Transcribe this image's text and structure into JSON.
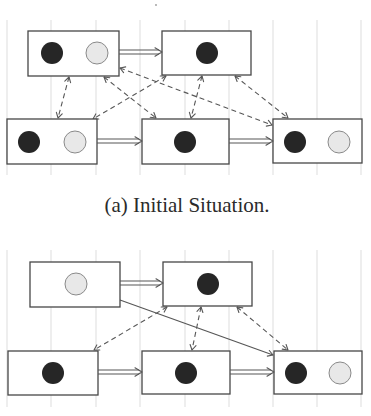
{
  "style": {
    "background": "#ffffff",
    "grid": "#d4d4d4",
    "box_stroke": "#474747",
    "box_fill": "#ffffff",
    "dark_token": "#262626",
    "light_token_fill": "#e8e8e8",
    "light_token_stroke": "#8a8a8a",
    "arrow": "#575757",
    "token_radius": 11
  },
  "figure": {
    "speck": {
      "cx": 156,
      "cy": 5
    },
    "panels": [
      {
        "id": "a",
        "caption": "(a) Initial Situation.",
        "caption_pos": {
          "x": 187,
          "y": 212
        },
        "gridlines": {
          "x": [
            7,
            51,
            96,
            140,
            185,
            229,
            273,
            317,
            361
          ],
          "y1": 20,
          "y2": 175
        },
        "boxes": [
          {
            "id": "A",
            "x": 28,
            "y": 31,
            "w": 91,
            "h": 45,
            "tokens": [
              {
                "cx": 52,
                "cy": 53,
                "kind": "dark"
              },
              {
                "cx": 97,
                "cy": 53,
                "kind": "light"
              }
            ]
          },
          {
            "id": "B",
            "x": 162,
            "y": 31,
            "w": 89,
            "h": 44,
            "tokens": [
              {
                "cx": 207,
                "cy": 53,
                "kind": "dark"
              }
            ]
          },
          {
            "id": "C",
            "x": 7,
            "y": 119,
            "w": 90,
            "h": 45,
            "tokens": [
              {
                "cx": 29,
                "cy": 142,
                "kind": "dark"
              },
              {
                "cx": 75,
                "cy": 142,
                "kind": "light"
              }
            ]
          },
          {
            "id": "D",
            "x": 142,
            "y": 119,
            "w": 87,
            "h": 45,
            "tokens": [
              {
                "cx": 185,
                "cy": 142,
                "kind": "dark"
              }
            ]
          },
          {
            "id": "E",
            "x": 273,
            "y": 119,
            "w": 89,
            "h": 44,
            "tokens": [
              {
                "cx": 295,
                "cy": 142,
                "kind": "dark"
              },
              {
                "cx": 339,
                "cy": 142,
                "kind": "light"
              }
            ]
          }
        ],
        "transitions": [
          {
            "from": "A",
            "to": "B",
            "x1": 119,
            "y1": 52,
            "x2": 162,
            "y2": 52
          },
          {
            "from": "C",
            "to": "D",
            "x1": 97,
            "y1": 141,
            "x2": 142,
            "y2": 141
          },
          {
            "from": "D",
            "to": "E",
            "x1": 229,
            "y1": 141,
            "x2": 273,
            "y2": 141
          }
        ],
        "dashed_links": [
          {
            "from": "A",
            "to": "C",
            "x1": 69,
            "y1": 77,
            "x2": 58,
            "y2": 118
          },
          {
            "from": "A",
            "to": "D",
            "x1": 104,
            "y1": 77,
            "x2": 156,
            "y2": 118
          },
          {
            "from": "A",
            "to": "E",
            "x1": 120,
            "y1": 68,
            "x2": 272,
            "y2": 125
          },
          {
            "from": "B",
            "to": "C",
            "x1": 166,
            "y1": 76,
            "x2": 93,
            "y2": 119
          },
          {
            "from": "B",
            "to": "D",
            "x1": 202,
            "y1": 76,
            "x2": 191,
            "y2": 118
          },
          {
            "from": "B",
            "to": "E",
            "x1": 235,
            "y1": 76,
            "x2": 288,
            "y2": 118
          }
        ],
        "solid_links": []
      },
      {
        "id": "b",
        "gridlines": {
          "x": [
            7,
            51,
            96,
            140,
            185,
            229,
            273,
            317,
            361
          ],
          "y1": 250,
          "y2": 407
        },
        "boxes": [
          {
            "id": "A",
            "x": 30,
            "y": 262,
            "w": 90,
            "h": 45,
            "tokens": [
              {
                "cx": 76,
                "cy": 284,
                "kind": "light"
              }
            ]
          },
          {
            "id": "B",
            "x": 163,
            "y": 262,
            "w": 89,
            "h": 44,
            "tokens": [
              {
                "cx": 208,
                "cy": 284,
                "kind": "dark"
              }
            ]
          },
          {
            "id": "C",
            "x": 8,
            "y": 351,
            "w": 90,
            "h": 44,
            "tokens": [
              {
                "cx": 53,
                "cy": 373,
                "kind": "dark"
              }
            ]
          },
          {
            "id": "D",
            "x": 142,
            "y": 351,
            "w": 88,
            "h": 43,
            "tokens": [
              {
                "cx": 186,
                "cy": 373,
                "kind": "dark"
              }
            ]
          },
          {
            "id": "E",
            "x": 274,
            "y": 351,
            "w": 88,
            "h": 43,
            "tokens": [
              {
                "cx": 296,
                "cy": 373,
                "kind": "dark"
              },
              {
                "cx": 340,
                "cy": 373,
                "kind": "light"
              }
            ]
          }
        ],
        "transitions": [
          {
            "from": "A",
            "to": "B",
            "x1": 120,
            "y1": 283,
            "x2": 163,
            "y2": 283
          },
          {
            "from": "C",
            "to": "D",
            "x1": 98,
            "y1": 372,
            "x2": 142,
            "y2": 372
          },
          {
            "from": "D",
            "to": "E",
            "x1": 230,
            "y1": 372,
            "x2": 274,
            "y2": 372
          }
        ],
        "dashed_links": [
          {
            "from": "B",
            "to": "C",
            "x1": 167,
            "y1": 307,
            "x2": 94,
            "y2": 350
          },
          {
            "from": "B",
            "to": "D",
            "x1": 201,
            "y1": 307,
            "x2": 192,
            "y2": 350
          },
          {
            "from": "B",
            "to": "E",
            "x1": 237,
            "y1": 307,
            "x2": 288,
            "y2": 350
          }
        ],
        "solid_links": [
          {
            "from": "A",
            "to": "E",
            "x1": 120,
            "y1": 300,
            "x2": 273,
            "y2": 355
          }
        ]
      }
    ]
  }
}
